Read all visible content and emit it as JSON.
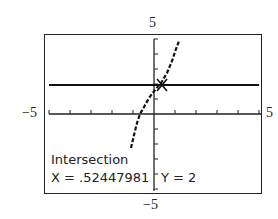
{
  "window": {
    "xmin_label": "−5",
    "xmax_label": "5",
    "ymax_label": "5",
    "ymin_label": "−5",
    "xmin": -5,
    "xmax": 5,
    "ymin": -5,
    "ymax": 5
  },
  "readout": {
    "title": "Intersection",
    "x_text": "X = .52447981",
    "y_text": "Y = 2"
  },
  "graph": {
    "horizontal_line_y": 2,
    "intersection": {
      "x": 0.52447981,
      "y": 2
    },
    "axis_color": "#222222",
    "curve_color": "#111111"
  }
}
